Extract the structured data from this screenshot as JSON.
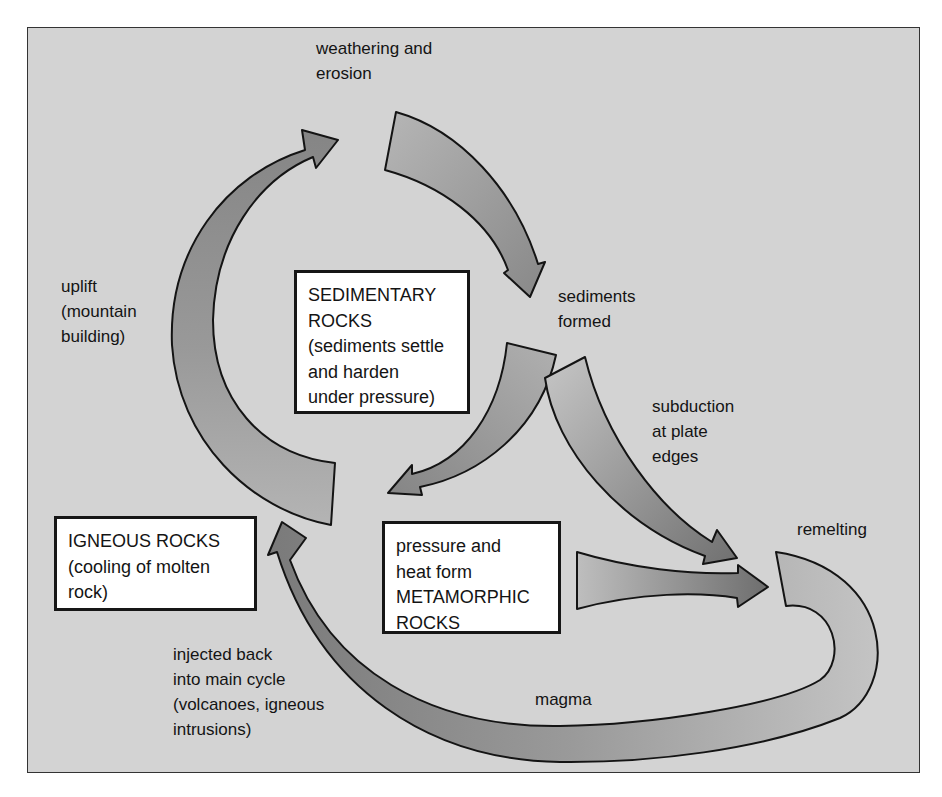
{
  "diagram": {
    "colors": {
      "background": "#d3d3d3",
      "frame_border": "#333333",
      "arrow_dark": "#7e7e7e",
      "arrow_light": "#b8b8b8",
      "box_fill": "#ffffff",
      "text": "#141414"
    },
    "boxes": {
      "sedimentary": "SEDIMENTARY\nROCKS\n(sediments settle\nand harden\nunder pressure)",
      "igneous": "IGNEOUS ROCKS\n(cooling of molten\nrock)",
      "metamorphic": "pressure and\nheat form\nMETAMORPHIC\nROCKS"
    },
    "labels": {
      "weathering": "weathering and\nerosion",
      "sediments_formed": "sediments\nformed",
      "uplift": "uplift\n(mountain\nbuilding)",
      "subduction": "subduction\nat plate\nedges",
      "remelting": "remelting",
      "magma": "magma",
      "injected": "injected back\ninto main cycle\n(volcanoes, igneous\nintrusions)"
    },
    "arrows": [
      {
        "id": "weathering-arrow",
        "from": "top",
        "to": "sediments formed"
      },
      {
        "id": "sediment-to-igneous-arrow",
        "from": "sediments formed",
        "to": "igneous / rock cycle"
      },
      {
        "id": "subduction-arrow",
        "from": "sediments formed",
        "to": "remelting"
      },
      {
        "id": "metamorphic-arrow",
        "from": "metamorphic rocks",
        "to": "remelting"
      },
      {
        "id": "magma-arrow",
        "from": "remelting",
        "to": "igneous rocks"
      },
      {
        "id": "uplift-arrow",
        "from": "igneous rocks",
        "to": "weathering and erosion"
      }
    ]
  }
}
